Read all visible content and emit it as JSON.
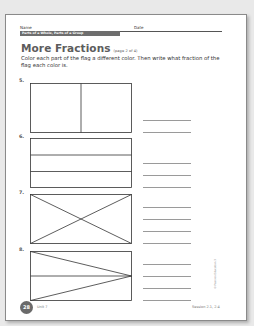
{
  "header": {
    "name_label": "Name",
    "date_label": "Date",
    "section_band": "Parts of a Whole, Parts of a Group"
  },
  "title": {
    "main": "More Fractions",
    "sub": "(page 2 of 4)"
  },
  "instructions": "Color each part of the flag a different color. Then write what fraction of the flag each color is.",
  "problems": [
    {
      "number": "5.",
      "flag": "two vertical halves",
      "answer_lines": 2
    },
    {
      "number": "6.",
      "flag": "three horizontal stripes",
      "answer_lines": 3
    },
    {
      "number": "7.",
      "flag": "rectangle divided by both diagonals into four triangles",
      "answer_lines": 4
    },
    {
      "number": "8.",
      "flag": "rectangle with triangles meeting at right-middle point, split by horizontal midline",
      "answer_lines": 4
    }
  ],
  "footer": {
    "page_number": "28",
    "unit": "Unit 7",
    "session": "Session 2.1, 2.4",
    "copyright": "© Pearson Education 3"
  },
  "colors": {
    "band": "#6e6e6e",
    "title": "#5c5c5c",
    "badge": "#6a6a6a"
  }
}
